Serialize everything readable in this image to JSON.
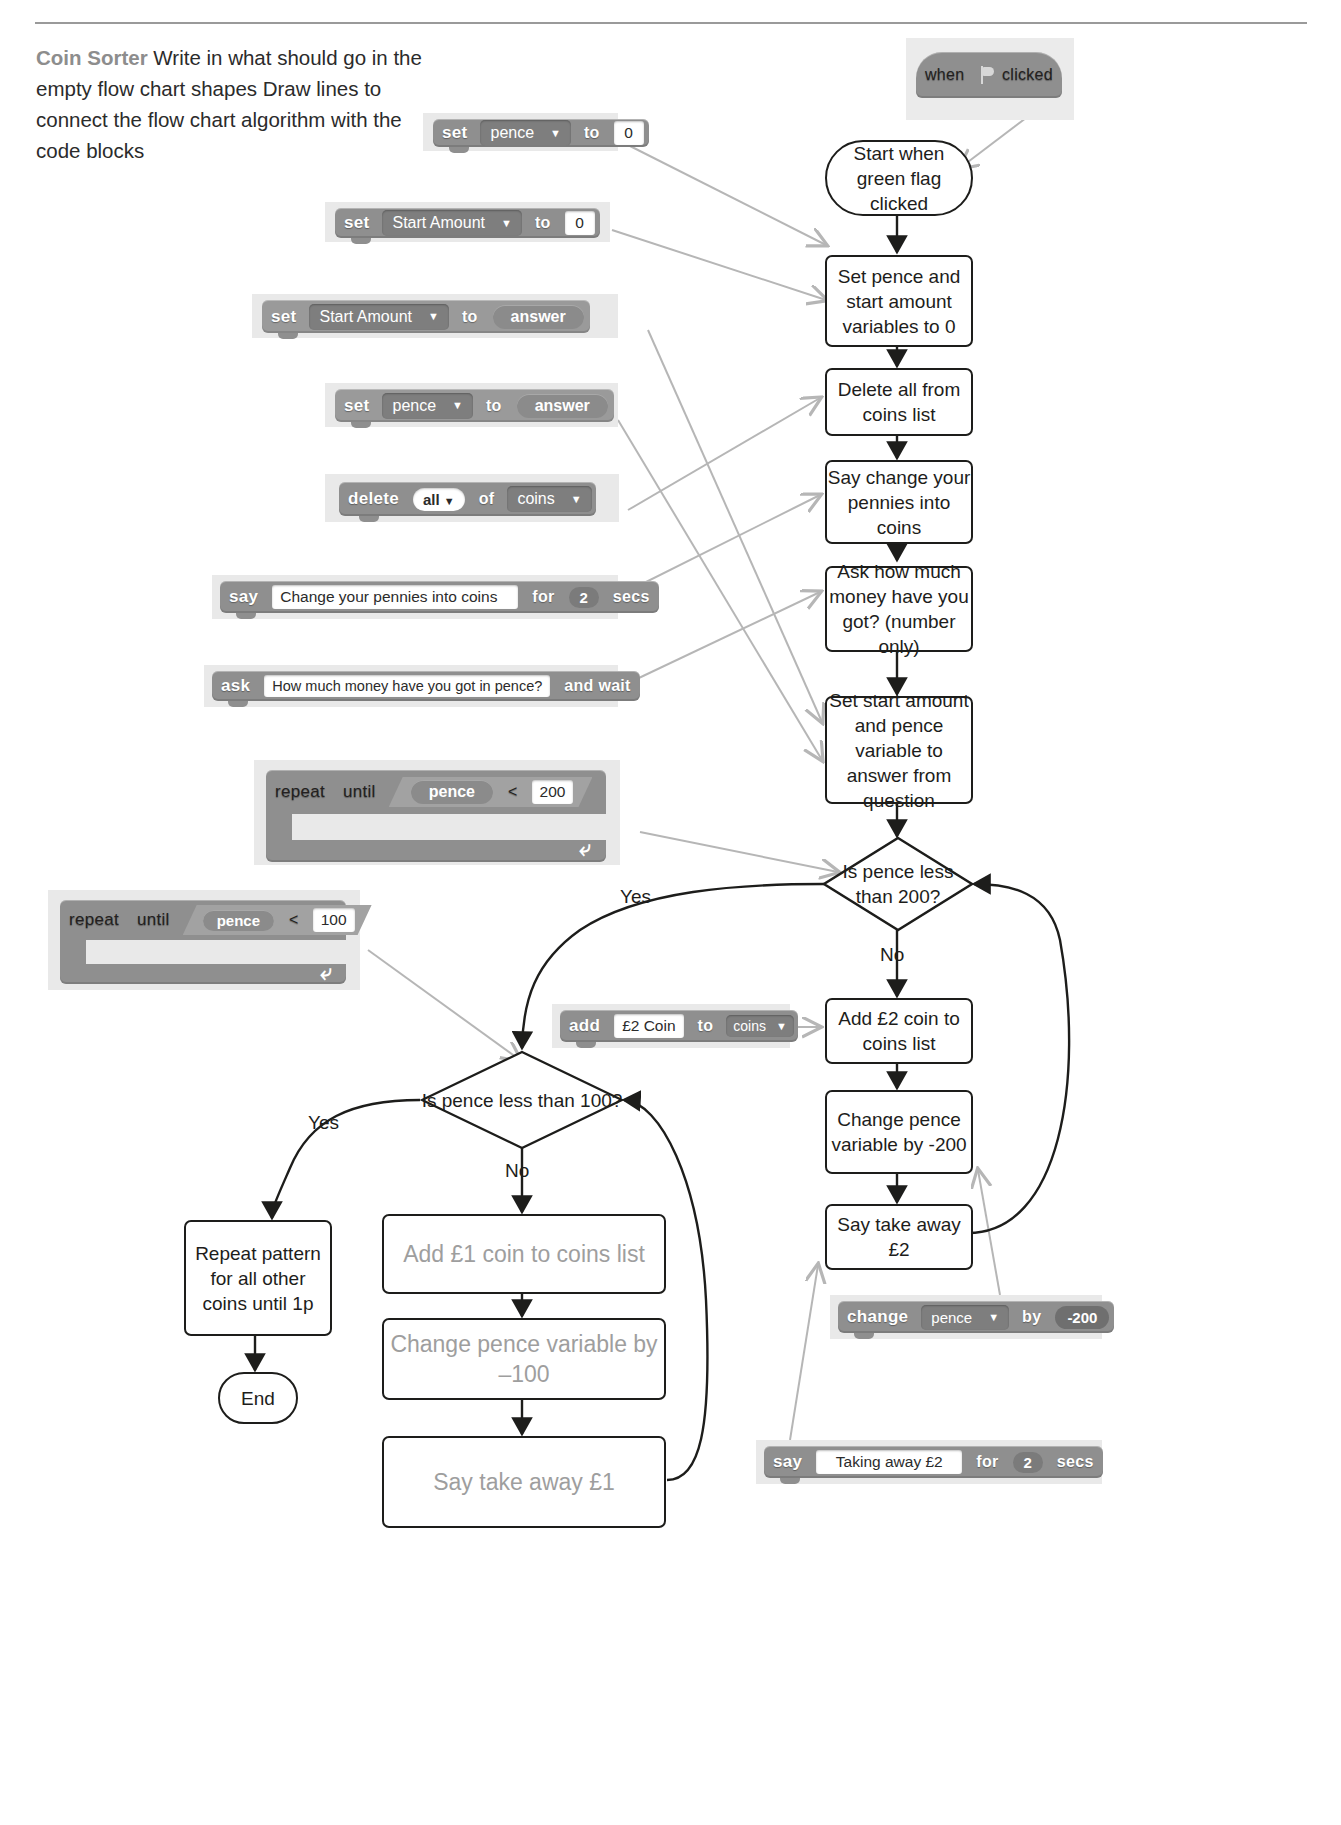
{
  "page": {
    "title": "Coin Sorter",
    "instructions_bold": "Coin Sorter",
    "instructions_rest": "Write in what should go in the empty flow chart shapes Draw lines to connect the flow chart algorithm with the code blocks"
  },
  "scratch_blocks": [
    {
      "id": "set-pence-0",
      "keyword": "set",
      "variable": "pence",
      "to_label": "to",
      "value": "0",
      "dropdown_icon": "chevron-down-icon"
    },
    {
      "id": "set-start-amount-0",
      "keyword": "set",
      "variable": "Start Amount",
      "to_label": "to",
      "value": "0",
      "dropdown_icon": "chevron-down-icon"
    },
    {
      "id": "set-start-amount-answer",
      "keyword": "set",
      "variable": "Start Amount",
      "to_label": "to",
      "value": "answer",
      "dropdown_icon": "chevron-down-icon"
    },
    {
      "id": "set-pence-answer",
      "keyword": "set",
      "variable": "pence",
      "to_label": "to",
      "value": "answer",
      "dropdown_icon": "chevron-down-icon"
    },
    {
      "id": "delete-all-of-coins",
      "keyword": "delete",
      "index": "all",
      "of_label": "of",
      "list": "coins",
      "dropdown_icon": "chevron-down-icon"
    },
    {
      "id": "say-change-pennies",
      "keyword": "say",
      "message": "Change your pennies into coins",
      "for_label": "for",
      "secs_value": "2",
      "secs_label": "secs"
    },
    {
      "id": "ask-how-much-money",
      "keyword": "ask",
      "question": "How much money have you got in pence?",
      "and_wait_label": "and  wait"
    },
    {
      "id": "repeat-until-pence-200",
      "keyword": "repeat",
      "until_label": "until",
      "operand": "pence",
      "operator": "<",
      "value": "200"
    },
    {
      "id": "repeat-until-pence-100",
      "keyword": "repeat",
      "until_label": "until",
      "operand": "pence",
      "operator": "<",
      "value": "100"
    },
    {
      "id": "add-e2-coin-to-coins",
      "keyword": "add",
      "item": "£2 Coin",
      "to_label": "to",
      "list": "coins",
      "dropdown_icon": "chevron-down-icon"
    },
    {
      "id": "change-pence-by-200",
      "keyword": "change",
      "variable": "pence",
      "by_label": "by",
      "value": "-200",
      "dropdown_icon": "chevron-down-icon"
    },
    {
      "id": "say-taking-away-e2",
      "keyword": "say",
      "message": "Taking away £2",
      "for_label": "for",
      "secs_value": "2",
      "secs_label": "secs"
    },
    {
      "id": "when-green-flag-clicked",
      "keyword": "when",
      "flag_icon": "green-flag-icon",
      "clicked_label": "clicked"
    }
  ],
  "flowchart": {
    "nodes": [
      {
        "id": "start",
        "shape": "terminator",
        "text": "Start when green flag clicked"
      },
      {
        "id": "set-vars",
        "shape": "process",
        "text": "Set pence and start amount variables to 0"
      },
      {
        "id": "delete-coins",
        "shape": "process",
        "text": "Delete all from coins list"
      },
      {
        "id": "say-change",
        "shape": "process",
        "text": "Say change your pennies into coins"
      },
      {
        "id": "ask-money",
        "shape": "process",
        "text": "Ask how much money have you got? (number only)"
      },
      {
        "id": "set-answer",
        "shape": "process",
        "text": "Set start amount and pence variable to answer from question"
      },
      {
        "id": "decision-200",
        "shape": "decision",
        "text": "Is pence less than 200?"
      },
      {
        "id": "add-e2",
        "shape": "process",
        "text": "Add £2 coin to coins list"
      },
      {
        "id": "change-200",
        "shape": "process",
        "text": "Change pence variable by -200"
      },
      {
        "id": "say-takeaway-e2",
        "shape": "process",
        "text": "Say take away £2"
      },
      {
        "id": "decision-100",
        "shape": "decision",
        "text": "Is pence less than 100?"
      },
      {
        "id": "repeat-pattern",
        "shape": "process",
        "text": "Repeat pattern for all other coins until 1p"
      },
      {
        "id": "end",
        "shape": "terminator",
        "text": "End"
      },
      {
        "id": "add-e1",
        "shape": "process",
        "text": "Add £1 coin to coins list",
        "faded": true
      },
      {
        "id": "change-100",
        "shape": "process",
        "text": "Change pence variable by –100",
        "faded": true
      },
      {
        "id": "say-takeaway-e1",
        "shape": "process",
        "text": "Say take away £1",
        "faded": true
      }
    ],
    "branch_labels": {
      "yes_200": "Yes",
      "no_200": "No",
      "yes_100": "Yes",
      "no_100": "No"
    }
  },
  "colors": {
    "block_grey": "#8f8f8f",
    "block_panel": "#e9e9e9",
    "line_black": "#1d1d1b",
    "connector_grey": "#b6b6b6",
    "faded_text": "#9e9e9e"
  }
}
